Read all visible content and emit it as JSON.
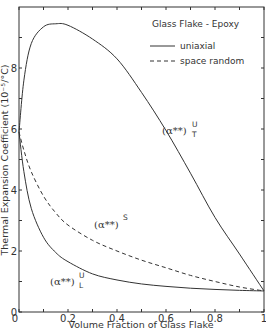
{
  "chart_data": {
    "type": "line",
    "title": "Glass Flake - Epoxy",
    "xlabel": "Volume Fraction of Glass Flake",
    "ylabel": "Thermal Expansion Coefficient (10⁻⁵/°C)",
    "xlim": [
      0,
      1
    ],
    "ylim": [
      0,
      10
    ],
    "xticks": [
      0,
      0.2,
      0.4,
      0.6,
      0.8,
      1
    ],
    "xtick_labels": [
      "0",
      "0.2",
      "0.4",
      "0.6",
      "0.8",
      "1"
    ],
    "yticks": [
      0,
      2,
      4,
      6,
      8
    ],
    "ytick_labels": [
      "0",
      "2",
      "4",
      "6",
      "8"
    ],
    "grid": false,
    "legend": {
      "position": "upper right",
      "entries": [
        {
          "label": "uniaxial",
          "style": "solid"
        },
        {
          "label": "space random",
          "style": "dashed"
        }
      ]
    },
    "series": [
      {
        "name": "(α**)T U",
        "label_main": "(α**)",
        "label_sup": "U",
        "label_sub": "T",
        "style": "solid",
        "x": [
          0,
          0.02,
          0.05,
          0.1,
          0.15,
          0.2,
          0.3,
          0.4,
          0.5,
          0.6,
          0.7,
          0.8,
          0.9,
          1.0
        ],
        "y": [
          5.9,
          7.6,
          8.8,
          9.35,
          9.45,
          9.4,
          8.95,
          8.3,
          7.2,
          5.95,
          4.55,
          3.1,
          1.9,
          0.69
        ]
      },
      {
        "name": "(α**)S",
        "label_main": "(α**)",
        "label_sup": "S",
        "label_sub": "",
        "style": "dashed",
        "x": [
          0,
          0.02,
          0.05,
          0.1,
          0.15,
          0.2,
          0.3,
          0.4,
          0.5,
          0.6,
          0.7,
          0.8,
          0.9,
          1.0
        ],
        "y": [
          5.9,
          5.3,
          4.6,
          3.8,
          3.25,
          2.85,
          2.35,
          2.0,
          1.7,
          1.45,
          1.2,
          1.0,
          0.82,
          0.69
        ]
      },
      {
        "name": "(α**)L U",
        "label_main": "(α**)",
        "label_sup": "U",
        "label_sub": "L",
        "style": "solid",
        "x": [
          0,
          0.02,
          0.05,
          0.1,
          0.15,
          0.2,
          0.3,
          0.4,
          0.5,
          0.6,
          0.7,
          0.8,
          0.9,
          1.0
        ],
        "y": [
          5.9,
          4.6,
          3.4,
          2.45,
          1.95,
          1.65,
          1.25,
          1.05,
          0.92,
          0.84,
          0.78,
          0.74,
          0.71,
          0.69
        ]
      }
    ]
  },
  "annotations": {
    "ut_label": {
      "main": "(α**)",
      "sup": "U",
      "sub": "T"
    },
    "s_label": {
      "main": "(α**)",
      "sup": "S"
    },
    "ul_label": {
      "main": "(α**)",
      "sup": "U",
      "sub": "L"
    }
  }
}
